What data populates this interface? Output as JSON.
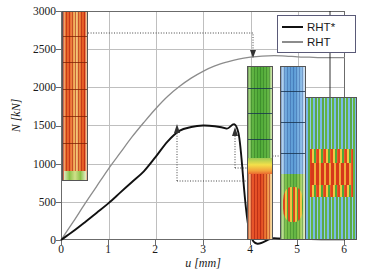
{
  "chart_data": {
    "type": "line",
    "title": "",
    "xlabel": "u [mm]",
    "ylabel": "N [kN]",
    "xlim": [
      0,
      6
    ],
    "ylim": [
      0,
      3000
    ],
    "xticks": [
      0,
      1,
      2,
      3,
      4,
      5,
      6
    ],
    "yticks": [
      0,
      500,
      1000,
      1500,
      2000,
      2500,
      3000
    ],
    "grid": true,
    "legend_position": "top-right",
    "series": [
      {
        "name": "RHT*",
        "color": "#111111",
        "x": [
          0,
          0.25,
          0.5,
          0.75,
          1.0,
          1.25,
          1.5,
          1.75,
          2.0,
          2.25,
          2.5,
          2.75,
          3.0,
          3.25,
          3.5,
          3.75,
          4.0,
          4.5,
          5.0,
          5.5,
          6.0
        ],
        "values": [
          0,
          110,
          230,
          355,
          480,
          620,
          760,
          900,
          1090,
          1290,
          1430,
          1480,
          1500,
          1490,
          1460,
          1400,
          60,
          25,
          15,
          10,
          10
        ]
      },
      {
        "name": "RHT",
        "color": "#8c8c8c",
        "x": [
          0,
          0.25,
          0.5,
          0.75,
          1.0,
          1.25,
          1.5,
          1.75,
          2.0,
          2.25,
          2.5,
          2.75,
          3.0,
          3.25,
          3.5,
          3.75,
          4.0,
          4.25,
          4.5,
          4.75,
          5.0,
          5.25,
          5.5,
          5.75,
          6.0
        ],
        "values": [
          0,
          230,
          470,
          700,
          930,
          1140,
          1350,
          1540,
          1720,
          1880,
          2010,
          2120,
          2210,
          2280,
          2330,
          2370,
          2395,
          2410,
          2415,
          2410,
          2400,
          2395,
          2390,
          2390,
          2390
        ]
      }
    ],
    "annotations": [
      {
        "name": "initial-state-callout",
        "text": "",
        "from_x": 0.3,
        "from_y": 2650,
        "to_x": 4.2,
        "to_y": 2480
      },
      {
        "name": "rht-star-peak-callout",
        "text": "",
        "from_x": 2.45,
        "from_y": 1000,
        "to_x": 2.45,
        "to_y": 1480
      },
      {
        "name": "rht-star-post-peak-callout",
        "text": "",
        "from_x": 3.73,
        "from_y": 1130,
        "to_x": 3.73,
        "to_y": 1410
      }
    ]
  },
  "legend": {
    "entries": [
      {
        "label": "RHT*",
        "color": "#111111"
      },
      {
        "label": "RHT",
        "color": "#8c8c8c"
      }
    ]
  },
  "axes": {
    "y_title": "N [kN]",
    "x_title": "u [mm]",
    "y_tick_labels": [
      "3000",
      "2500",
      "2000",
      "1500",
      "1000",
      "500",
      "0"
    ],
    "x_tick_labels": [
      "0",
      "1",
      "2",
      "3",
      "4",
      "5",
      "6"
    ]
  },
  "thumbnails": [
    {
      "name": "initial-damage-state",
      "caption": ""
    },
    {
      "name": "rht-star-failure-state",
      "caption": ""
    },
    {
      "name": "rht-failure-state",
      "caption": ""
    },
    {
      "name": "rht-failure-detail-zoom",
      "caption": ""
    }
  ]
}
